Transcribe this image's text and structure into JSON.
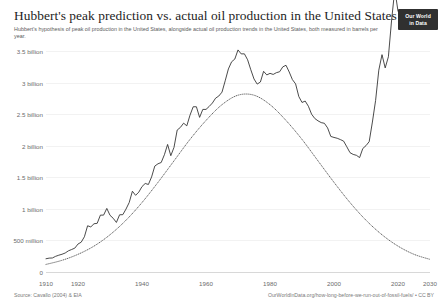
{
  "header": {
    "title": "Hubbert's peak prediction vs. actual oil production in the United States",
    "subtitle": "Hubbert's hypothesis of peak oil production in the United States, alongside actual oil production trends in the United States, both measured in barrels per year.",
    "logo_line1": "Our World",
    "logo_line2": "in Data"
  },
  "footer": {
    "source": "Source: Cavallo (2004) & EIA",
    "license": "OurWorldInData.org/how-long-before-we-run-out-of-fossil-fuels/ • CC BY"
  },
  "colors": {
    "actual_line": "#2b2b2b",
    "hubbert_line": "#4a4a4a",
    "gridline": "#f2f2f2",
    "axis": "#d8d8d8",
    "text": "#1d1d1d",
    "muted_text": "#6b6b6b",
    "logo_bg": "#303030"
  },
  "chart_data": {
    "type": "line",
    "title": "Hubbert's peak prediction vs. actual oil production in the United States",
    "subtitle": "Hubbert's hypothesis of peak oil production in the United States, alongside actual oil production trends in the United States, both measured in barrels per year.",
    "xlabel": "",
    "ylabel": "",
    "xlim": [
      1910,
      2030
    ],
    "ylim": [
      0,
      3500000000
    ],
    "grid": true,
    "legend_position": "none",
    "x_tick_labels": [
      "1910",
      "1920",
      "1940",
      "1960",
      "1980",
      "2000",
      "2020",
      "2030"
    ],
    "x_tick_values": [
      1910,
      1920,
      1940,
      1960,
      1980,
      2000,
      2020,
      2030
    ],
    "y_tick_labels": [
      "0",
      "500 million",
      "1 billion",
      "1.5 billion",
      "2 billion",
      "2.5 billion",
      "3 billion",
      "3.5 billion"
    ],
    "y_tick_values": [
      0,
      500000000,
      1000000000,
      1500000000,
      2000000000,
      2500000000,
      3000000000,
      3500000000
    ],
    "series": [
      {
        "name": "Actual oil production",
        "style": "solid",
        "color": "#2b2b2b",
        "x": [
          1910,
          1911,
          1912,
          1913,
          1914,
          1915,
          1916,
          1917,
          1918,
          1919,
          1920,
          1921,
          1922,
          1923,
          1924,
          1925,
          1926,
          1927,
          1928,
          1929,
          1930,
          1931,
          1932,
          1933,
          1934,
          1935,
          1936,
          1937,
          1938,
          1939,
          1940,
          1941,
          1942,
          1943,
          1944,
          1945,
          1946,
          1947,
          1948,
          1949,
          1950,
          1951,
          1952,
          1953,
          1954,
          1955,
          1956,
          1957,
          1958,
          1959,
          1960,
          1961,
          1962,
          1963,
          1964,
          1965,
          1966,
          1967,
          1968,
          1969,
          1970,
          1971,
          1972,
          1973,
          1974,
          1975,
          1976,
          1977,
          1978,
          1979,
          1980,
          1981,
          1982,
          1983,
          1984,
          1985,
          1986,
          1987,
          1988,
          1989,
          1990,
          1991,
          1992,
          1993,
          1994,
          1995,
          1996,
          1997,
          1998,
          1999,
          2000,
          2001,
          2002,
          2003,
          2004,
          2005,
          2006,
          2007,
          2008,
          2009,
          2010,
          2011,
          2012,
          2013,
          2014,
          2015,
          2016,
          2017,
          2018,
          2019,
          2020
        ],
        "values": [
          210000000,
          220000000,
          222000000,
          248000000,
          266000000,
          281000000,
          301000000,
          335000000,
          356000000,
          378000000,
          443000000,
          472000000,
          558000000,
          732000000,
          714000000,
          764000000,
          771000000,
          901000000,
          901000000,
          1007000000,
          898000000,
          851000000,
          785000000,
          906000000,
          908000000,
          997000000,
          1100000000,
          1279000000,
          1214000000,
          1265000000,
          1353000000,
          1402000000,
          1386000000,
          1506000000,
          1678000000,
          1714000000,
          1734000000,
          1857000000,
          2020000000,
          1842000000,
          1974000000,
          2248000000,
          2290000000,
          2357000000,
          2315000000,
          2484000000,
          2617000000,
          2617000000,
          2449000000,
          2575000000,
          2575000000,
          2622000000,
          2676000000,
          2753000000,
          2787000000,
          2849000000,
          3028000000,
          3216000000,
          3329000000,
          3372000000,
          3517000000,
          3454000000,
          3455000000,
          3361000000,
          3203000000,
          3057000000,
          2976000000,
          3009000000,
          3178000000,
          3121000000,
          3146000000,
          3129000000,
          3157000000,
          3171000000,
          3249000000,
          3274000000,
          3168000000,
          3047000000,
          2979000000,
          2779000000,
          2685000000,
          2707000000,
          2625000000,
          2499000000,
          2431000000,
          2394000000,
          2366000000,
          2355000000,
          2282000000,
          2147000000,
          2131000000,
          2118000000,
          2097000000,
          2073000000,
          1983000000,
          1890000000,
          1862000000,
          1848000000,
          1812000000,
          1956000000,
          2001000000,
          2065000000,
          2375000000,
          2717000000,
          3197000000,
          3442000000,
          3232000000,
          3409000000,
          3990000000,
          4475000000,
          4130000000
        ]
      },
      {
        "name": "Hubbert's peak prediction",
        "style": "dotted",
        "color": "#4a4a4a",
        "x": [
          1910,
          1915,
          1920,
          1925,
          1930,
          1935,
          1940,
          1945,
          1950,
          1955,
          1960,
          1965,
          1970,
          1975,
          1980,
          1985,
          1990,
          1995,
          2000,
          2005,
          2010,
          2015,
          2020,
          2025,
          2030
        ],
        "values": [
          120000000,
          185000000,
          280000000,
          410000000,
          590000000,
          820000000,
          1100000000,
          1420000000,
          1760000000,
          2100000000,
          2400000000,
          2650000000,
          2800000000,
          2800000000,
          2650000000,
          2400000000,
          2100000000,
          1760000000,
          1420000000,
          1100000000,
          820000000,
          590000000,
          410000000,
          280000000,
          200000000
        ]
      }
    ]
  }
}
